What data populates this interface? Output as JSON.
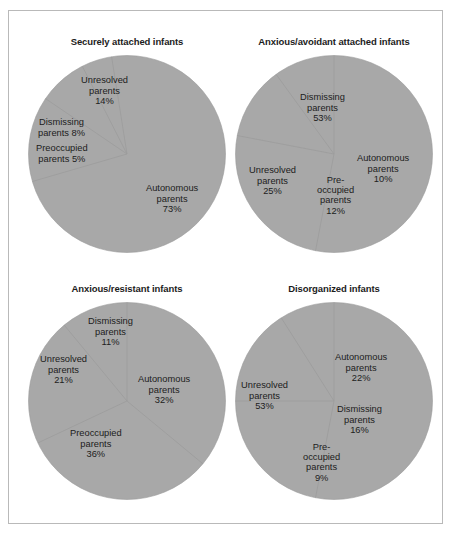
{
  "figure": {
    "background_color": "#ffffff",
    "frame_color": "#b9b9b9",
    "pie_fill_color": "#a8a8a8",
    "pie_edge_color": "#9a9a9a",
    "text_color": "#202020"
  },
  "chart_data": [
    {
      "type": "pie",
      "title": "Securely attached infants",
      "categories": [
        "Autonomous parents",
        "Unresolved parents",
        "Dismissing parents",
        "Preoccupied parents"
      ],
      "values": [
        73,
        14,
        8,
        5
      ],
      "labels": [
        {
          "name": "Unresolved parents",
          "line1": "Unresolved",
          "line2": "parents",
          "value_text": "14%",
          "value": 14,
          "layout": "stacked"
        },
        {
          "name": "Dismissing parents",
          "line1": "Dismissing",
          "line2": "parents  8%",
          "value_text": "8%",
          "value": 8,
          "layout": "inline"
        },
        {
          "name": "Preoccupied parents",
          "line1": "Preoccupied",
          "line2": "parents  5%",
          "value_text": "5%",
          "value": 5,
          "layout": "inline"
        },
        {
          "name": "Autonomous parents",
          "line1": "Autonomous",
          "line2": "parents",
          "value_text": "73%",
          "value": 73,
          "layout": "stacked"
        }
      ],
      "legend": "none",
      "grid": false
    },
    {
      "type": "pie",
      "title": "Anxious/avoidant attached infants",
      "categories": [
        "Dismissing parents",
        "Unresolved parents",
        "Preoccupied parents",
        "Autonomous parents"
      ],
      "values": [
        53,
        25,
        12,
        10
      ],
      "labels": [
        {
          "name": "Dismissing parents",
          "line1": "Dismissing",
          "line2": "parents",
          "value_text": "53%",
          "value": 53,
          "layout": "stacked"
        },
        {
          "name": "Unresolved parents",
          "line1": "Unresolved",
          "line2": "parents",
          "value_text": "25%",
          "value": 25,
          "layout": "stacked"
        },
        {
          "name": "Autonomous parents",
          "line1": "Autonomous",
          "line2": "parents",
          "value_text": "10%",
          "value": 10,
          "layout": "stacked"
        },
        {
          "name": "Preoccupied parents",
          "line1": "Pre-",
          "line2": "occupied",
          "line3": "parents",
          "value_text": "12%",
          "value": 12,
          "layout": "stacked3"
        }
      ],
      "legend": "none",
      "grid": false
    },
    {
      "type": "pie",
      "title": "Anxious/resistant infants",
      "categories": [
        "Preoccupied parents",
        "Autonomous parents",
        "Unresolved parents",
        "Dismissing parents"
      ],
      "values": [
        36,
        32,
        21,
        11
      ],
      "labels": [
        {
          "name": "Dismissing parents",
          "line1": "Dismissing",
          "line2": "parents",
          "value_text": "11%",
          "value": 11,
          "layout": "stacked"
        },
        {
          "name": "Unresolved parents",
          "line1": "Unresolved",
          "line2": "parents",
          "value_text": "21%",
          "value": 21,
          "layout": "stacked"
        },
        {
          "name": "Autonomous parents",
          "line1": "Autonomous",
          "line2": "parents",
          "value_text": "32%",
          "value": 32,
          "layout": "stacked"
        },
        {
          "name": "Preoccupied parents",
          "line1": "Preoccupied",
          "line2": "parents",
          "value_text": "36%",
          "value": 36,
          "layout": "stacked"
        }
      ],
      "legend": "none",
      "grid": false
    },
    {
      "type": "pie",
      "title": "Disorganized infants",
      "categories": [
        "Unresolved parents",
        "Autonomous parents",
        "Dismissing parents",
        "Preoccupied parents"
      ],
      "values": [
        53,
        22,
        16,
        9
      ],
      "labels": [
        {
          "name": "Autonomous parents",
          "line1": "Autonomous",
          "line2": "parents",
          "value_text": "22%",
          "value": 22,
          "layout": "stacked"
        },
        {
          "name": "Unresolved parents",
          "line1": "Unresolved",
          "line2": "parents",
          "value_text": "53%",
          "value": 53,
          "layout": "stacked"
        },
        {
          "name": "Dismissing parents",
          "line1": "Dismissing",
          "line2": "parents",
          "value_text": "16%",
          "value": 16,
          "layout": "stacked"
        },
        {
          "name": "Preoccupied parents",
          "line1": "Pre-",
          "line2": "occupied",
          "line3": "parents",
          "value_text": "9%",
          "value": 9,
          "layout": "stacked3"
        }
      ],
      "legend": "none",
      "grid": false
    }
  ],
  "label_positions": [
    [
      {
        "x": 63,
        "y": 20
      },
      {
        "x": 20,
        "y": 62
      },
      {
        "x": 18,
        "y": 88
      },
      {
        "x": 128,
        "y": 128
      }
    ],
    [
      {
        "x": 75,
        "y": 37
      },
      {
        "x": 24,
        "y": 110
      },
      {
        "x": 132,
        "y": 98
      },
      {
        "x": 92,
        "y": 120
      }
    ],
    [
      {
        "x": 70,
        "y": 14
      },
      {
        "x": 22,
        "y": 52
      },
      {
        "x": 120,
        "y": 72
      },
      {
        "x": 52,
        "y": 126
      }
    ],
    [
      {
        "x": 110,
        "y": 50
      },
      {
        "x": 16,
        "y": 78
      },
      {
        "x": 112,
        "y": 102
      },
      {
        "x": 78,
        "y": 140
      }
    ]
  ],
  "pie_geometry": [
    {
      "start_angle_deg": -9,
      "direction": "clockwise"
    },
    {
      "start_angle_deg": 0,
      "direction": "clockwise"
    },
    {
      "start_angle_deg": 0,
      "direction": "clockwise"
    },
    {
      "start_angle_deg": 0,
      "direction": "clockwise"
    }
  ]
}
